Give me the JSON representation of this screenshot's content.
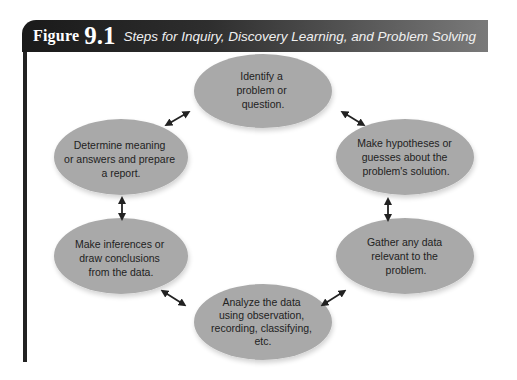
{
  "figure": {
    "label_word": "Figure",
    "label_number": "9.1",
    "title": "Steps for Inquiry, Discovery Learning, and Problem Solving"
  },
  "colors": {
    "node_fill": "#a9a9a9",
    "arrow": "#222222",
    "header_dark": "#1a1a1a",
    "header_light": "#7a7a7a"
  },
  "nodes": [
    {
      "id": "identify",
      "lines": [
        "Identify a",
        "problem or",
        "question."
      ]
    },
    {
      "id": "hypotheses",
      "lines": [
        "Make hypotheses or",
        "guesses about the",
        "problem's solution."
      ]
    },
    {
      "id": "gather",
      "lines": [
        "Gather any data",
        "relevant to the",
        "problem."
      ]
    },
    {
      "id": "analyze",
      "lines": [
        "Analyze the data",
        "using observation,",
        "recording, classifying,",
        "etc."
      ]
    },
    {
      "id": "infer",
      "lines": [
        "Make inferences or",
        "draw conclusions",
        "from the data."
      ]
    },
    {
      "id": "report",
      "lines": [
        "Determine meaning",
        "or answers and prepare",
        "a report."
      ]
    }
  ],
  "edges": [
    {
      "from": "identify",
      "to": "hypotheses",
      "type": "bidirectional"
    },
    {
      "from": "hypotheses",
      "to": "gather",
      "type": "bidirectional"
    },
    {
      "from": "gather",
      "to": "analyze",
      "type": "bidirectional"
    },
    {
      "from": "analyze",
      "to": "infer",
      "type": "bidirectional"
    },
    {
      "from": "infer",
      "to": "report",
      "type": "bidirectional"
    },
    {
      "from": "report",
      "to": "identify",
      "type": "bidirectional"
    }
  ]
}
